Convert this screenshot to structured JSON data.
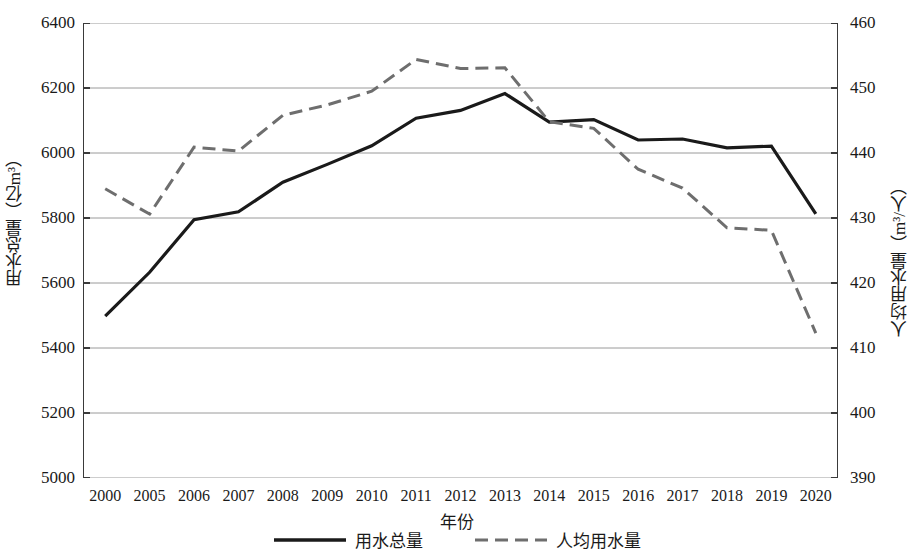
{
  "chart_data": {
    "type": "line",
    "title": "",
    "xlabel": "年份",
    "categories": [
      "2000",
      "2005",
      "2006",
      "2007",
      "2008",
      "2009",
      "2010",
      "2011",
      "2012",
      "2013",
      "2014",
      "2015",
      "2016",
      "2017",
      "2018",
      "2019",
      "2020"
    ],
    "grid": true,
    "legend_position": "bottom",
    "axes": {
      "left": {
        "label": "用水总量（亿m³）",
        "ylim": [
          5000,
          6400
        ],
        "ticks": [
          5000,
          5200,
          5400,
          5600,
          5800,
          6000,
          6200,
          6400
        ],
        "tick_labels": [
          "5000",
          "5200",
          "5400",
          "5600",
          "5800",
          "6000",
          "6200",
          "6400"
        ]
      },
      "right": {
        "label": "人均用水量（m³/人）",
        "ylim": [
          390,
          460
        ],
        "ticks": [
          390,
          400,
          410,
          420,
          430,
          440,
          450,
          460
        ],
        "tick_labels": [
          "390",
          "400",
          "410",
          "420",
          "430",
          "440",
          "450",
          "460"
        ]
      }
    },
    "series": [
      {
        "name": "用水总量",
        "axis": "left",
        "style": "solid",
        "color": "#1a1a1a",
        "width": 3.2,
        "values": [
          5498,
          5633,
          5795,
          5819,
          5910,
          5965,
          6022,
          6107,
          6131,
          6183,
          6095,
          6103,
          6040,
          6043,
          6016,
          6021,
          5813
        ]
      },
      {
        "name": "人均用水量",
        "axis": "right",
        "style": "dashed",
        "color": "#6e6e6e",
        "width": 3.0,
        "values": [
          434.5,
          430.6,
          440.9,
          440.3,
          445.8,
          447.4,
          449.5,
          454.4,
          453.0,
          453.1,
          444.8,
          443.8,
          437.5,
          434.6,
          428.5,
          428.1,
          412.3
        ]
      }
    ]
  },
  "legend": {
    "entries": [
      {
        "label": "用水总量",
        "style": "solid",
        "color": "#1a1a1a"
      },
      {
        "label": "人均用水量",
        "style": "dashed",
        "color": "#6e6e6e"
      }
    ]
  }
}
